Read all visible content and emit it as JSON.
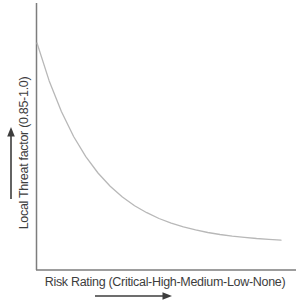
{
  "figure": {
    "background": "#ffffff"
  },
  "colors": {
    "axis_line": "#7d7d7d",
    "curve": "#b8b8b8",
    "text": "#3d3d3d",
    "arrow": "#3d3d3d"
  },
  "chart_data": {
    "type": "line",
    "title": "",
    "xlabel": "Risk Rating (Critical-High-Medium-Low-None)",
    "ylabel": "Local Threat factor (0.85-1.0)",
    "x_categories": [
      "Critical",
      "High",
      "Medium",
      "Low",
      "None"
    ],
    "x_tick_labels_shown": false,
    "y_tick_labels_shown": false,
    "grid": false,
    "legend": null,
    "xlim": [
      0,
      1
    ],
    "ylim": [
      0.85,
      1.0
    ],
    "axis_arrows": {
      "y": "up",
      "x": "right"
    },
    "shape": "exponential decay: threat factor falls from 1.0 at Critical toward 0.85 asymptote at None",
    "series": [
      {
        "name": "Local threat factor",
        "x": [
          0,
          0.05,
          0.1,
          0.15,
          0.2,
          0.25,
          0.3,
          0.35,
          0.4,
          0.45,
          0.5,
          0.55,
          0.6,
          0.65,
          0.7,
          0.75,
          0.8,
          0.85,
          0.9,
          0.95,
          1.0
        ],
        "y": [
          1.0,
          0.9716,
          0.9486,
          0.9299,
          0.9148,
          0.9025,
          0.8926,
          0.8845,
          0.878,
          0.8727,
          0.8684,
          0.8649,
          0.8621,
          0.8598,
          0.8579,
          0.8564,
          0.8552,
          0.8542,
          0.8534,
          0.8528,
          0.8522
        ]
      }
    ]
  }
}
